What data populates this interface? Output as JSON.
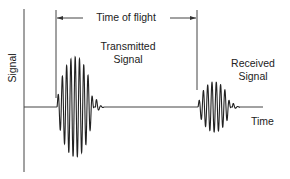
{
  "diagram": {
    "axes": {
      "y_label": "Signal",
      "x_label": "Time"
    },
    "annotations": {
      "time_of_flight": "Time of flight",
      "transmitted_line1": "Transmitted",
      "transmitted_line2": "Signal",
      "received_line1": "Received",
      "received_line2": "Signal"
    },
    "colors": {
      "line": "#333333",
      "text": "#222222",
      "background": "#ffffff"
    },
    "pulses": [
      {
        "name": "transmitted",
        "start_x": 57,
        "end_x": 104,
        "amplitude_px": 50,
        "cycles": 9
      },
      {
        "name": "received",
        "start_x": 198,
        "end_x": 240,
        "amplitude_px": 25,
        "cycles": 8
      }
    ]
  }
}
